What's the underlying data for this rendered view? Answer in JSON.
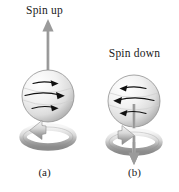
{
  "figure": {
    "type": "physics-diagram",
    "background_color": "#ffffff",
    "width": 179,
    "height": 192,
    "panels": [
      {
        "id": "a",
        "caption": "(a)",
        "spin_label": "Spin up",
        "axis_arrow_direction": "up",
        "axis_arrow_color": "#9a9a9a",
        "sphere": {
          "center_x": 48,
          "center_y": 96,
          "radius": 26,
          "fill_light": "#ffffff",
          "fill_dark": "#b9b9b9",
          "outline_color": "#8c8c8c"
        },
        "surface_arrows_direction": "right",
        "surface_arrow_color": "#111111",
        "surface_arrow_count": 3,
        "rotation_ring": {
          "center_x": 48,
          "center_y": 137,
          "rx": 25,
          "ry": 10,
          "arrowhead_direction": "left",
          "color_light": "#efefef",
          "color_dark": "#8f8f8f"
        }
      },
      {
        "id": "b",
        "caption": "(b)",
        "spin_label": "Spin down",
        "axis_arrow_direction": "down",
        "axis_arrow_color": "#9a9a9a",
        "sphere": {
          "center_x": 44,
          "center_y": 101,
          "radius": 26,
          "fill_light": "#ffffff",
          "fill_dark": "#b9b9b9",
          "outline_color": "#8c8c8c"
        },
        "surface_arrows_direction": "left",
        "surface_arrow_color": "#111111",
        "surface_arrow_count": 3,
        "rotation_ring": {
          "center_x": 44,
          "center_y": 142,
          "rx": 25,
          "ry": 10,
          "arrowhead_direction": "right",
          "color_light": "#efefef",
          "color_dark": "#8f8f8f"
        }
      }
    ]
  }
}
